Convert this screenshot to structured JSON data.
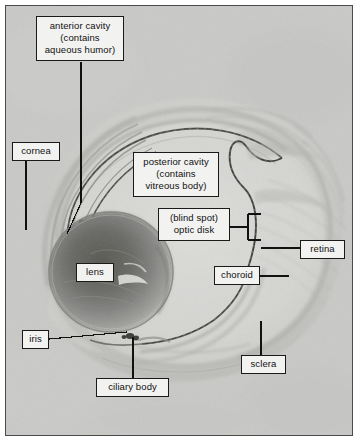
{
  "figure": {
    "background_color": "#c9c9c7",
    "frame_color": "#4a4a4a",
    "label_box_fill": "#f2f2f0",
    "label_text_color": "#111111",
    "leader_line_color": "#111111"
  },
  "labels": [
    {
      "id": "anterior-cavity",
      "text": "anterior cavity\n(contains\naqueous humor)",
      "lines": [
        "anterior cavity",
        "(contains",
        "aqueous humor)"
      ],
      "leader": "bent-line-down-left"
    },
    {
      "id": "cornea",
      "text": "cornea",
      "lines": [
        "cornea"
      ],
      "leader": "line-down"
    },
    {
      "id": "posterior-cavity",
      "text": "posterior cavity\n(contains\nvitreous body)",
      "lines": [
        "posterior cavity",
        "(contains",
        "vitreous body)"
      ],
      "leader": "none"
    },
    {
      "id": "blind-spot-optic-disk",
      "text": "(blind spot)\noptic disk",
      "lines": [
        "(blind spot)",
        "optic disk"
      ],
      "leader": "bracket-right"
    },
    {
      "id": "retina",
      "text": "retina",
      "lines": [
        "retina"
      ],
      "leader": "line-left"
    },
    {
      "id": "lens",
      "text": "lens",
      "lines": [
        "lens"
      ],
      "leader": "none"
    },
    {
      "id": "choroid",
      "text": "choroid",
      "lines": [
        "choroid"
      ],
      "leader": "line-right"
    },
    {
      "id": "iris",
      "text": "iris",
      "lines": [
        "iris"
      ],
      "leader": "line-right"
    },
    {
      "id": "sclera",
      "text": "sclera",
      "lines": [
        "sclera"
      ],
      "leader": "line-up"
    },
    {
      "id": "ciliary-body",
      "text": "ciliary body",
      "lines": [
        "ciliary body"
      ],
      "leader": "line-up"
    }
  ]
}
